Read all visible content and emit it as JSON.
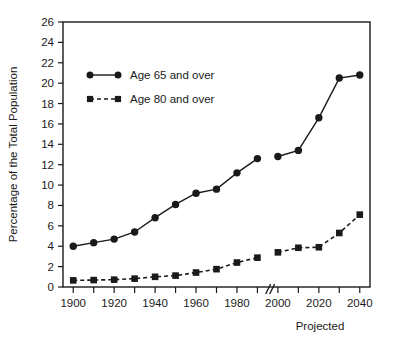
{
  "chart_data": {
    "type": "line",
    "title": "",
    "xlabel": "",
    "ylabel": "Percentage of the Total Population",
    "annotation": "Projected",
    "grid": false,
    "legend_position": "upper-left-inside",
    "xlim": [
      1895,
      2045
    ],
    "ylim": [
      0,
      26
    ],
    "ytick_step": 2,
    "xtick_step": 10,
    "x_tick_labels": [
      "1900",
      "1920",
      "1940",
      "1960",
      "1980",
      "2000",
      "2020",
      "2040"
    ],
    "y_tick_labels": [
      "0",
      "2",
      "4",
      "6",
      "8",
      "10",
      "12",
      "14",
      "16",
      "18",
      "20",
      "22",
      "24",
      "26"
    ],
    "axis_break_after_x": 1990,
    "axis_break_symbol": "//",
    "x": [
      1900,
      1910,
      1920,
      1930,
      1940,
      1950,
      1960,
      1970,
      1980,
      1990,
      2000,
      2010,
      2020,
      2030,
      2040
    ],
    "series": [
      {
        "name": "Age 65 and over",
        "marker": "circle",
        "linestyle": "solid",
        "color": "#1a1a1a",
        "values": [
          4.0,
          4.35,
          4.7,
          5.4,
          6.8,
          8.1,
          9.2,
          9.6,
          11.2,
          12.6,
          12.8,
          13.4,
          16.6,
          20.5,
          20.8
        ]
      },
      {
        "name": "Age 80 and over",
        "marker": "square",
        "linestyle": "dashed",
        "color": "#1a1a1a",
        "values": [
          0.65,
          0.68,
          0.72,
          0.82,
          1.0,
          1.12,
          1.42,
          1.75,
          2.4,
          2.88,
          3.4,
          3.85,
          3.9,
          5.3,
          7.1
        ]
      }
    ]
  },
  "legend": {
    "items": [
      {
        "label": "Age 65 and over"
      },
      {
        "label": "Age 80 and over"
      }
    ]
  },
  "labels": {
    "y_axis_title": "Percentage of the Total Population",
    "projected_note": "Projected"
  }
}
